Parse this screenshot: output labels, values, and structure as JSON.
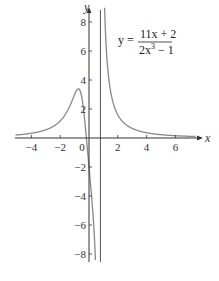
{
  "chart_data": {
    "type": "line",
    "title": "",
    "function": "y = (11x + 2)/(2x^3 - 1)",
    "annotation": {
      "lhs": "y =",
      "numerator": "11x + 2",
      "denominator": "2x",
      "denominator_exp": "3",
      "denominator_tail": " − 1"
    },
    "xlabel": "x",
    "ylabel": "y",
    "xlim": [
      -4.5,
      7.2
    ],
    "ylim": [
      -8.5,
      9
    ],
    "xticks": [
      -4,
      -2,
      0,
      2,
      4,
      6
    ],
    "xtick_labels": [
      "−4",
      "−2",
      "0",
      "2",
      "4",
      "6"
    ],
    "yticks": [
      -8,
      -6,
      -4,
      -2,
      2,
      4,
      6,
      8
    ],
    "ytick_labels": [
      "−8",
      "−6",
      "−4",
      "−2",
      "2",
      "4",
      "6",
      "8"
    ],
    "vertical_asymptote": 0.794,
    "horizontal_asymptote": 0,
    "local_max": {
      "x": -0.75,
      "y": 3.5
    },
    "sample_points": [
      {
        "x": -4,
        "y": 0.33
      },
      {
        "x": -2,
        "y": 1.18
      },
      {
        "x": -1,
        "y": 3
      },
      {
        "x": -0.75,
        "y": 3.5
      },
      {
        "x": -0.5,
        "y": 2.8
      },
      {
        "x": -0.18,
        "y": 0
      },
      {
        "x": 0,
        "y": -2
      },
      {
        "x": 0.5,
        "y": -10
      },
      {
        "x": 1,
        "y": 13
      },
      {
        "x": 2,
        "y": 1.6
      },
      {
        "x": 4,
        "y": 0.36
      },
      {
        "x": 6,
        "y": 0.16
      }
    ],
    "grid": false,
    "legend": null
  },
  "colors": {
    "axis": "#333333",
    "curve": "#888888",
    "asymptote": "#555555"
  }
}
